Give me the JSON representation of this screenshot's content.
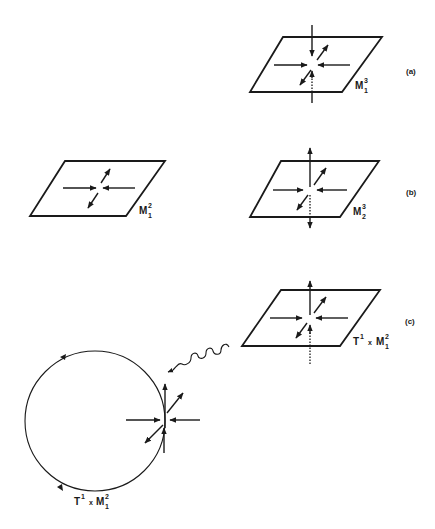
{
  "figure": {
    "panels": [
      {
        "id": "a",
        "label": "(a)",
        "manifold_label": "M",
        "manifold_sup": "3",
        "manifold_sub": "1"
      },
      {
        "id": "b-left",
        "label": "",
        "manifold_label": "M",
        "manifold_sup": "2",
        "manifold_sub": "1"
      },
      {
        "id": "b",
        "label": "(b)",
        "manifold_label": "M",
        "manifold_sup": "3",
        "manifold_sub": "2"
      },
      {
        "id": "c",
        "label": "(c)",
        "manifold_prefix": "T",
        "manifold_prefix_sup": "1",
        "manifold_times": "x",
        "manifold_label": "M",
        "manifold_sup": "2",
        "manifold_sub": "1"
      }
    ],
    "orbit": {
      "prefix": "T",
      "prefix_sup": "1",
      "times": "x",
      "manifold_label": "M",
      "manifold_sup": "2",
      "manifold_sub": "1"
    }
  }
}
